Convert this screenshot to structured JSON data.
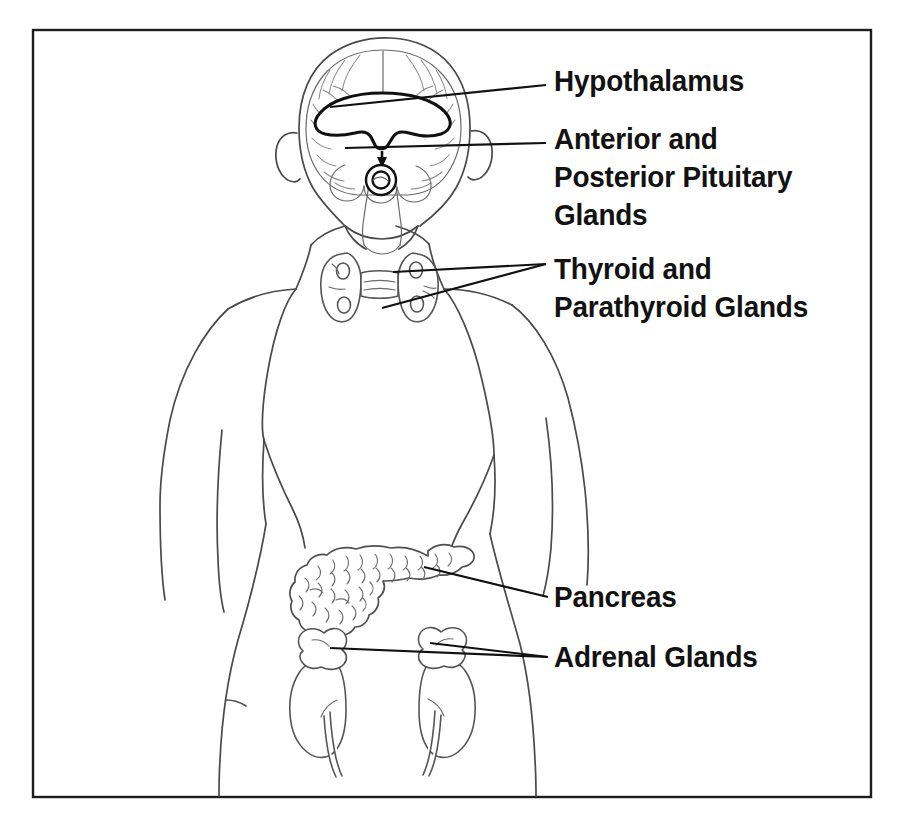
{
  "figure": {
    "background_color": "#ffffff",
    "frame": {
      "name": "diagram-border",
      "color": "#1d1d1d",
      "x": 33,
      "y": 30,
      "width": 838,
      "height": 767
    },
    "line_art_color": "#4a4a4a",
    "label_color": "#121212",
    "highlight_color": "#101010"
  },
  "labels": [
    {
      "id": "hypothalamus",
      "text": "Hypothalamus",
      "x": 554,
      "y": 62,
      "leader_from": [
        330,
        107
      ],
      "leader_to": [
        546,
        85
      ]
    },
    {
      "id": "pituitary",
      "text": "Anterior and\nPosterior Pituitary\nGlands",
      "x": 554,
      "y": 120,
      "leader_from": [
        345,
        148
      ],
      "leader_to": [
        546,
        143
      ]
    },
    {
      "id": "thyroid",
      "text": "Thyroid and\nParathyroid Glands",
      "x": 554,
      "y": 250,
      "leader_from": [
        393,
        272
      ],
      "leader_to": [
        546,
        264
      ]
    },
    {
      "id": "pancreas",
      "text": "Pancreas",
      "x": 554,
      "y": 578,
      "leader_from": [
        424,
        567
      ],
      "leader_to": [
        548,
        597
      ]
    },
    {
      "id": "adrenal",
      "text": "Adrenal Glands",
      "x": 554,
      "y": 638,
      "leader_from": [
        330,
        648
      ],
      "leader_to": [
        548,
        657
      ]
    }
  ],
  "anatomy": {
    "figure_view": "posterior torso outline",
    "structures": [
      {
        "name": "head",
        "label": "Head and neck outline"
      },
      {
        "name": "brain",
        "label": "Brain with cerebral hemispheres and cerebellum"
      },
      {
        "name": "hypothalamus",
        "label": "Hypothalamus"
      },
      {
        "name": "pituitary-gland",
        "label": "Anterior and Posterior Pituitary Glands"
      },
      {
        "name": "thyroid-gland",
        "label": "Thyroid gland with two lobes and isthmus"
      },
      {
        "name": "parathyroid-glands",
        "label": "Four parathyroid glands"
      },
      {
        "name": "torso",
        "label": "Torso, shoulders and arms"
      },
      {
        "name": "pancreas",
        "label": "Pancreas"
      },
      {
        "name": "left-kidney",
        "label": "Left kidney"
      },
      {
        "name": "right-kidney",
        "label": "Right kidney"
      },
      {
        "name": "left-adrenal-gland",
        "label": "Left adrenal gland"
      },
      {
        "name": "right-adrenal-gland",
        "label": "Right adrenal gland"
      }
    ]
  }
}
